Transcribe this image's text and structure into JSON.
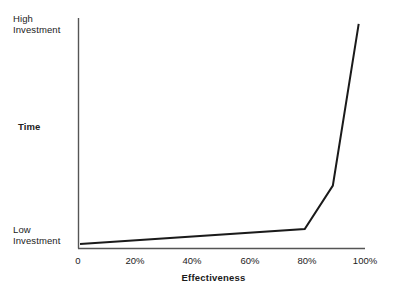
{
  "chart_data": {
    "type": "line",
    "title": "",
    "xlabel": "Effectiveness",
    "ylabel": "Time",
    "xlim": [
      0,
      100
    ],
    "ylim": [
      0,
      100
    ],
    "grid": false,
    "legend": false,
    "x_tick_labels": [
      "0",
      "20%",
      "40%",
      "60%",
      "80%",
      "100%"
    ],
    "x_tick_values": [
      0,
      20,
      40,
      60,
      80,
      100
    ],
    "y_tick_labels": [
      "Low\nInvestment",
      "High\nInvestment"
    ],
    "y_tick_values": [
      0,
      100
    ],
    "series": [
      {
        "name": "Time vs Effectiveness",
        "color": "#1a1a1a",
        "x": [
          0.7,
          79.0,
          88.8,
          97.8
        ],
        "y": [
          1.7,
          8.3,
          27.4,
          98.3
        ]
      }
    ]
  },
  "axes": {
    "y_top_label_line1": "High",
    "y_top_label_line2": "Investment",
    "y_bottom_label_line1": "Low",
    "y_bottom_label_line2": "Investment",
    "y_axis_title": "Time",
    "x_axis_title": "Effectiveness",
    "tick_0": "0",
    "tick_20": "20%",
    "tick_40": "40%",
    "tick_60": "60%",
    "tick_80": "80%",
    "tick_100": "100%"
  },
  "colors": {
    "line": "#1a1a1a",
    "axis": "#555555",
    "text": "#1a1a1a",
    "background": "#ffffff"
  }
}
